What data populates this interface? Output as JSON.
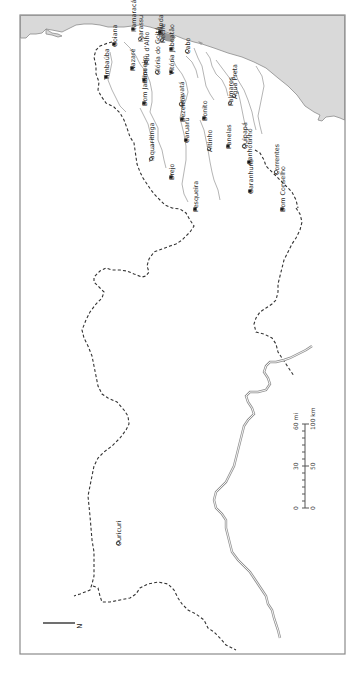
{
  "map": {
    "orientation": "rotated 90 degrees counter-clockwise (north points left)",
    "north_label": "N",
    "places": [
      {
        "name": "Goiana",
        "type": "major",
        "x": 114,
        "y": 44
      },
      {
        "name": "Itamaracá",
        "type": "major",
        "x": 133,
        "y": 29
      },
      {
        "name": "Timbaúba",
        "type": "major",
        "x": 106,
        "y": 77
      },
      {
        "name": "Igarassu",
        "type": "minor",
        "x": 140,
        "y": 39
      },
      {
        "name": "Olinda",
        "type": "major",
        "x": 160,
        "y": 32
      },
      {
        "name": "Pau d'Alho",
        "type": "minor",
        "x": 146,
        "y": 62
      },
      {
        "name": "Nazaré",
        "type": "major",
        "x": 132,
        "y": 68
      },
      {
        "name": "Recife",
        "type": "minor",
        "x": 162,
        "y": 40
      },
      {
        "name": "Jaboatão",
        "type": "major",
        "x": 171,
        "y": 49
      },
      {
        "name": "Cabo",
        "type": "minor",
        "x": 187,
        "y": 51
      },
      {
        "name": "Limoeiro",
        "type": "major",
        "x": 144,
        "y": 80
      },
      {
        "name": "Glória do Goitá",
        "type": "minor",
        "x": 157,
        "y": 72
      },
      {
        "name": "Vitória",
        "type": "major",
        "x": 171,
        "y": 72
      },
      {
        "name": "Bom Jardim",
        "type": "major",
        "x": 144,
        "y": 103
      },
      {
        "name": "Gravatá",
        "type": "minor",
        "x": 181,
        "y": 104
      },
      {
        "name": "Bonito",
        "type": "major",
        "x": 204,
        "y": 118
      },
      {
        "name": "Bezerros",
        "type": "major",
        "x": 182,
        "y": 119
      },
      {
        "name": "Caruaru",
        "type": "major",
        "x": 186,
        "y": 140
      },
      {
        "name": "Palmares",
        "type": "minor",
        "x": 230,
        "y": 103
      },
      {
        "name": "Água Preta",
        "type": "minor",
        "x": 234,
        "y": 96
      },
      {
        "name": "Altinho",
        "type": "minor",
        "x": 209,
        "y": 149
      },
      {
        "name": "Panelas",
        "type": "major",
        "x": 228,
        "y": 146
      },
      {
        "name": "Quipapá",
        "type": "minor",
        "x": 244,
        "y": 146
      },
      {
        "name": "Taquaritinga",
        "type": "minor",
        "x": 151,
        "y": 159
      },
      {
        "name": "Brejo",
        "type": "major",
        "x": 171,
        "y": 177
      },
      {
        "name": "Canhotinho",
        "type": "major",
        "x": 249,
        "y": 162
      },
      {
        "name": "Correntes",
        "type": "minor",
        "x": 276,
        "y": 172
      },
      {
        "name": "Garanhuns",
        "type": "major",
        "x": 250,
        "y": 191
      },
      {
        "name": "Pesqueira",
        "type": "major",
        "x": 195,
        "y": 209
      },
      {
        "name": "Bom Conselho",
        "type": "major",
        "x": 282,
        "y": 209
      },
      {
        "name": "Ouricuri",
        "type": "minor",
        "x": 118,
        "y": 543
      }
    ],
    "scale_bar": {
      "miles_ticks": [
        "0",
        "30",
        "60 mi"
      ],
      "km_ticks": [
        "0",
        "50",
        "100 km"
      ]
    },
    "colors": {
      "sea": "#d9d9d9",
      "urban_area": "#9a9a9a",
      "border": "#333333",
      "river": "#b5b5b5",
      "sao_francisco_river": "#8f8f8f",
      "frame": "#8a8a8a"
    }
  }
}
